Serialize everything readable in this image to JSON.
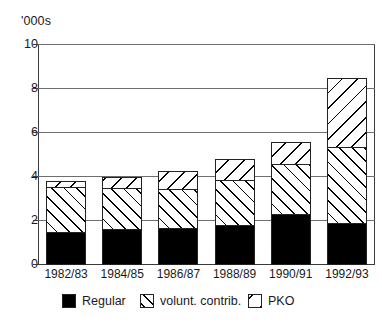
{
  "axis": {
    "unit_caption": "'000s",
    "y_ticks": [
      "10",
      "8",
      "6",
      "4",
      "2",
      "0"
    ],
    "y_tick_values": [
      10,
      8,
      6,
      4,
      2,
      0
    ]
  },
  "legend": {
    "items": [
      {
        "label": "Regular",
        "swatch": "solid-black-swatch"
      },
      {
        "label": "volunt. contrib.",
        "swatch": "forward-hatch-swatch"
      },
      {
        "label": "PKO",
        "swatch": "back-hatch-swatch"
      }
    ]
  },
  "chart_data": {
    "type": "bar",
    "title": "",
    "subtitle": "",
    "xlabel": "",
    "ylabel": "'000s",
    "ylim": [
      0,
      10
    ],
    "yticks": [
      0,
      2,
      4,
      6,
      8,
      10
    ],
    "grid": true,
    "stacked": true,
    "legend_position": "bottom",
    "categories": [
      "1982/83",
      "1984/85",
      "1986/87",
      "1988/89",
      "1990/91",
      "1992/93"
    ],
    "series": [
      {
        "name": "Regular",
        "values": [
          1.5,
          1.65,
          1.7,
          1.8,
          2.3,
          1.9
        ]
      },
      {
        "name": "volunt. contrib.",
        "values": [
          2.1,
          1.9,
          1.8,
          2.1,
          2.35,
          3.5
        ]
      },
      {
        "name": "PKO",
        "values": [
          0.3,
          0.55,
          0.85,
          1.0,
          1.05,
          3.2
        ]
      }
    ],
    "totals": [
      3.9,
      4.1,
      4.35,
      4.9,
      5.7,
      8.6
    ]
  }
}
